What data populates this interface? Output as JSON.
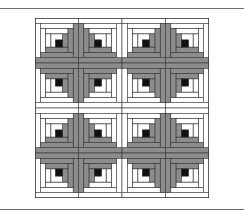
{
  "figure": {
    "rows": 4,
    "cols": 4,
    "rings": 3,
    "colors": {
      "dark": "#8c8c8c",
      "light": "#ffffff",
      "center": "#111111",
      "outline": "#333333",
      "rule": "#6e6e6e"
    },
    "blocks": [
      [
        "right-bottom",
        "left-bottom",
        "right-bottom",
        "left-bottom"
      ],
      [
        "right-top",
        "left-top",
        "right-top",
        "left-top"
      ],
      [
        "right-bottom",
        "left-bottom",
        "right-bottom",
        "left-bottom"
      ],
      [
        "right-top",
        "left-top",
        "right-top",
        "left-top"
      ]
    ]
  }
}
